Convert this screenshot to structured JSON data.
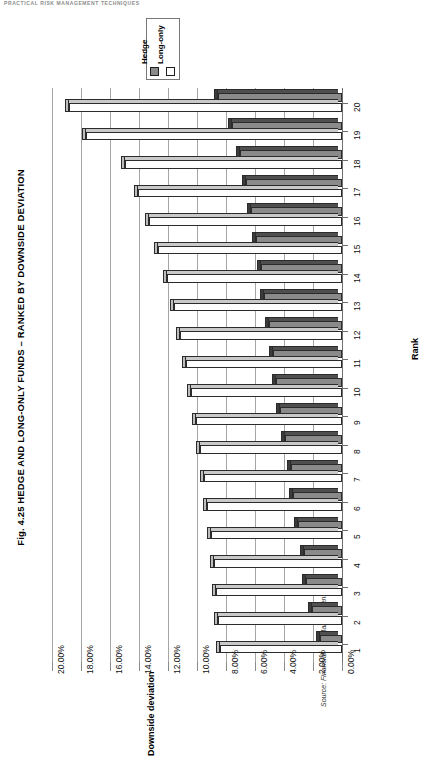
{
  "running_head": "PRACTICAL RISK MANAGEMENT TECHNIQUES",
  "figure": {
    "title": "Fig. 4.25  HEDGE AND LONG-ONLY FUNDS – RANKED BY DOWNSIDE DEVIATION",
    "source": "Source: Financial Risk Management"
  },
  "legend": {
    "position": "top-left",
    "entries": [
      {
        "label": "Hedge",
        "color": "#8a8a8a"
      },
      {
        "label": "Long-only",
        "color": "#ffffff"
      }
    ]
  },
  "chart_data": {
    "type": "bar",
    "orientation": "vertical-3d",
    "title": "Fig. 4.25  HEDGE AND LONG-ONLY FUNDS – RANKED BY DOWNSIDE DEVIATION",
    "xlabel": "Rank",
    "ylabel": "Downside deviation",
    "ylim": [
      0,
      20
    ],
    "yticks": [
      "0.00%",
      "2.00%",
      "4.00%",
      "6.00%",
      "8.00%",
      "10.00%",
      "12.00%",
      "14.00%",
      "16.00%",
      "18.00%",
      "20.00%"
    ],
    "ytick_values": [
      0,
      2,
      4,
      6,
      8,
      10,
      12,
      14,
      16,
      18,
      20
    ],
    "grid": true,
    "legend_position": "top-left",
    "categories": [
      "1",
      "2",
      "3",
      "4",
      "5",
      "6",
      "7",
      "8",
      "9",
      "10",
      "11",
      "12",
      "13",
      "14",
      "15",
      "16",
      "17",
      "18",
      "19",
      "20"
    ],
    "series": [
      {
        "name": "Hedge",
        "color": "#8a8a8a",
        "values": [
          1.55,
          2.05,
          2.45,
          2.6,
          3.05,
          3.35,
          3.55,
          3.95,
          4.25,
          4.55,
          4.75,
          5.05,
          5.35,
          5.6,
          5.95,
          6.25,
          6.6,
          7.05,
          7.6,
          8.55
        ]
      },
      {
        "name": "Long-only",
        "color": "#ffffff",
        "values": [
          8.4,
          8.55,
          8.7,
          8.85,
          9.05,
          9.3,
          9.55,
          9.8,
          10.1,
          10.4,
          10.75,
          11.15,
          11.6,
          12.1,
          12.7,
          13.3,
          14.05,
          15.0,
          17.65,
          18.8
        ]
      }
    ]
  }
}
